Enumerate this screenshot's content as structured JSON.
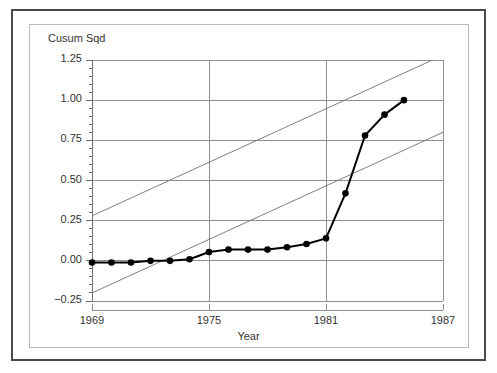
{
  "figure": {
    "background": "#ffffff",
    "frame_color": "#4a4a4a",
    "panel_border_color": "#b9b9b9"
  },
  "labels": {
    "y_axis_title": "Cusum Sqd",
    "x_axis_title": "Year"
  },
  "chart_data": {
    "type": "line",
    "title": "",
    "subtitle": "",
    "xlabel": "Year",
    "ylabel": "Cusum Sqd",
    "xlim": [
      1969,
      1987
    ],
    "ylim": [
      -0.25,
      1.25
    ],
    "grid": true,
    "legend": "none",
    "x_ticks": [
      1969,
      1975,
      1981,
      1987
    ],
    "x_tick_labels": [
      "1969",
      "1975",
      "1981",
      "1987"
    ],
    "y_ticks": [
      -0.25,
      0.0,
      0.25,
      0.5,
      0.75,
      1.0,
      1.25
    ],
    "y_tick_labels": [
      "−0.25",
      "0.00",
      "0.25",
      "0.50",
      "0.75",
      "1.00",
      "1.25"
    ],
    "y_minor_tick_step": 0.05,
    "series": [
      {
        "name": "Cusum of Squares",
        "type": "line",
        "marker": "filled-circle",
        "color": "#000000",
        "line_width": 2,
        "x": [
          1969,
          1970,
          1971,
          1972,
          1973,
          1974,
          1975,
          1976,
          1977,
          1978,
          1979,
          1980,
          1981,
          1982,
          1983,
          1984,
          1985
        ],
        "values": [
          -0.01,
          -0.01,
          -0.01,
          0.0,
          0.0,
          0.01,
          0.055,
          0.07,
          0.07,
          0.07,
          0.085,
          0.105,
          0.14,
          0.42,
          0.78,
          0.91,
          1.0
        ]
      },
      {
        "name": "Upper 5% significance bound",
        "type": "line",
        "color": "#808080",
        "line_width": 1,
        "x": [
          1969,
          1987
        ],
        "values": [
          0.28,
          1.28
        ]
      },
      {
        "name": "Lower 5% significance bound",
        "type": "line",
        "color": "#808080",
        "line_width": 1,
        "x": [
          1969,
          1987
        ],
        "values": [
          -0.2,
          0.8
        ]
      }
    ]
  }
}
